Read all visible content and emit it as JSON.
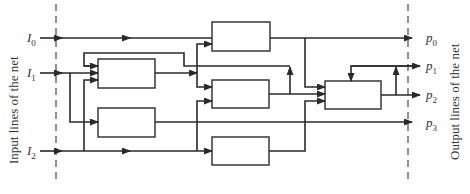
{
  "diagram": {
    "left_caption": "Input lines of the net",
    "right_caption": "Output lines of the net",
    "inputs": [
      {
        "base": "I",
        "sub": "0"
      },
      {
        "base": "I",
        "sub": "1"
      },
      {
        "base": "I",
        "sub": "2"
      }
    ],
    "outputs": [
      {
        "base": "p",
        "sub": "0"
      },
      {
        "base": "p",
        "sub": "1"
      },
      {
        "base": "p",
        "sub": "2"
      },
      {
        "base": "p",
        "sub": "3"
      }
    ],
    "blocks": [
      {
        "id": "left-upper"
      },
      {
        "id": "left-lower"
      },
      {
        "id": "center-top"
      },
      {
        "id": "center-middle"
      },
      {
        "id": "center-bottom"
      },
      {
        "id": "right"
      }
    ],
    "colors": {
      "line": "#2a2a2a",
      "background": "#ffffff"
    }
  }
}
